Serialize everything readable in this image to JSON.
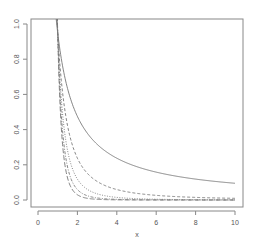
{
  "chart_data": {
    "type": "line",
    "title": "",
    "xlabel": "x",
    "ylabel": "",
    "xlim": [
      -0.4,
      10.3
    ],
    "ylim": [
      -0.04,
      1.04
    ],
    "x_ticks": [
      0,
      2,
      4,
      6,
      8,
      10
    ],
    "x_tick_labels": [
      "0",
      "2",
      "4",
      "6",
      "8",
      "10"
    ],
    "y_ticks": [
      0.0,
      0.2,
      0.4,
      0.6,
      0.8,
      1.0
    ],
    "y_tick_labels": [
      "0.0",
      "0.2",
      "0.4",
      "0.6",
      "0.8",
      "1.0"
    ],
    "grid": false,
    "legend": null,
    "series": [
      {
        "name": "curve-1",
        "style": "solid",
        "formula": "0.95/x",
        "exponent": 1,
        "scale": 0.95,
        "x": [
          1,
          2,
          4,
          6,
          8,
          10
        ],
        "values": [
          0.95,
          0.475,
          0.24,
          0.16,
          0.12,
          0.095
        ]
      },
      {
        "name": "curve-2",
        "style": "dashed",
        "formula": "1/x^2",
        "exponent": 2,
        "scale": 0.95,
        "x": [
          1,
          2,
          4,
          6,
          8,
          10
        ],
        "values": [
          0.95,
          0.24,
          0.06,
          0.026,
          0.015,
          0.0095
        ]
      },
      {
        "name": "curve-3",
        "style": "dotted",
        "formula": "1/x^3",
        "exponent": 3,
        "scale": 0.95,
        "x": [
          1,
          2,
          4,
          6,
          8,
          10
        ],
        "values": [
          0.95,
          0.12,
          0.015,
          0.004,
          0.002,
          0.001
        ]
      },
      {
        "name": "curve-4",
        "style": "dotdash",
        "formula": "1/x^4",
        "exponent": 4,
        "scale": 0.95,
        "x": [
          1,
          2,
          4,
          6,
          8,
          10
        ],
        "values": [
          0.95,
          0.06,
          0.004,
          0.001,
          0.0,
          0.0
        ]
      },
      {
        "name": "curve-5",
        "style": "longdash",
        "formula": "1/x^5",
        "exponent": 5,
        "scale": 0.95,
        "x": [
          1,
          2,
          4,
          6,
          8,
          10
        ],
        "values": [
          0.95,
          0.03,
          0.001,
          0.0,
          0.0,
          0.0
        ]
      }
    ],
    "x_domain": [
      0.45,
      10
    ]
  },
  "colors": {
    "axis": "#888888",
    "line": "#777777",
    "text": "#555555"
  },
  "layout": {
    "plot_box": {
      "left": 31,
      "top": 19,
      "right": 243,
      "bottom": 207
    },
    "x_px": {
      "at0": 38,
      "per_unit": 19.7
    },
    "y_px": {
      "at0": 200,
      "per_unit": 176
    }
  }
}
